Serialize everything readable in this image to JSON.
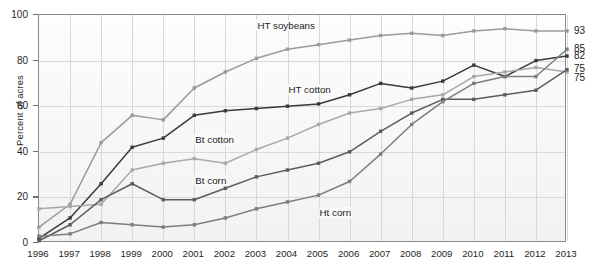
{
  "chart_data": {
    "type": "line",
    "title": "",
    "subtitle": "",
    "xlabel": "",
    "ylabel": "Percent of acres",
    "x": [
      1996,
      1997,
      1998,
      1999,
      2000,
      2001,
      2002,
      2003,
      2004,
      2005,
      2006,
      2007,
      2008,
      2009,
      2010,
      2011,
      2012,
      2013
    ],
    "xtick_labels": [
      "1996",
      "1997",
      "1998",
      "1999",
      "2000",
      "2001",
      "2002",
      "2003",
      "2004",
      "2005",
      "2006",
      "2007",
      "2008",
      "2009",
      "2010",
      "2011",
      "2012",
      "2013"
    ],
    "ytick_labels": [
      "0",
      "20",
      "40",
      "60",
      "80",
      "100"
    ],
    "yticks": [
      0,
      20,
      40,
      60,
      80,
      100
    ],
    "ylim": [
      0,
      100
    ],
    "xlim": [
      1996,
      2013
    ],
    "grid": true,
    "legend": "inline-labels",
    "series": [
      {
        "name": "HT soybeans",
        "color": "#9a9a9a",
        "label_x": 2003,
        "label_y": 95,
        "end_value": 93,
        "values": [
          7,
          17,
          44,
          56,
          54,
          68,
          75,
          81,
          85,
          87,
          89,
          91,
          92,
          91,
          93,
          94,
          93,
          93
        ]
      },
      {
        "name": "HT cotton",
        "color": "#3a3a3a",
        "label_x": 2004,
        "label_y": 67,
        "end_value": 82,
        "values": [
          2,
          11,
          26,
          42,
          46,
          56,
          58,
          59,
          60,
          61,
          65,
          70,
          68,
          71,
          78,
          73,
          80,
          82
        ]
      },
      {
        "name": "Bt cotton",
        "color": "#a8a8a8",
        "label_x": 2001,
        "label_y": 45,
        "end_value": 75,
        "values": [
          15,
          16,
          17,
          32,
          35,
          37,
          35,
          41,
          46,
          52,
          57,
          59,
          63,
          65,
          73,
          75,
          77,
          75
        ]
      },
      {
        "name": "Bt corn",
        "color": "#5c5c5c",
        "label_x": 2001,
        "label_y": 27,
        "end_value": 75,
        "values": [
          1,
          8,
          19,
          26,
          19,
          19,
          24,
          29,
          32,
          35,
          40,
          49,
          57,
          63,
          63,
          65,
          67,
          76
        ]
      },
      {
        "name": "Ht corn",
        "color": "#7d7d7d",
        "label_x": 2005,
        "label_y": 13,
        "end_value": 85,
        "values": [
          3,
          4,
          9,
          8,
          7,
          8,
          11,
          15,
          18,
          21,
          27,
          39,
          52,
          62,
          70,
          73,
          73,
          85
        ]
      }
    ],
    "end_labels": [
      {
        "value": "93",
        "y": 93
      },
      {
        "value": "85",
        "y": 85
      },
      {
        "value": "82",
        "y": 82
      },
      {
        "value": "75",
        "y": 76.5
      },
      {
        "value": "75",
        "y": 72.5
      }
    ]
  }
}
